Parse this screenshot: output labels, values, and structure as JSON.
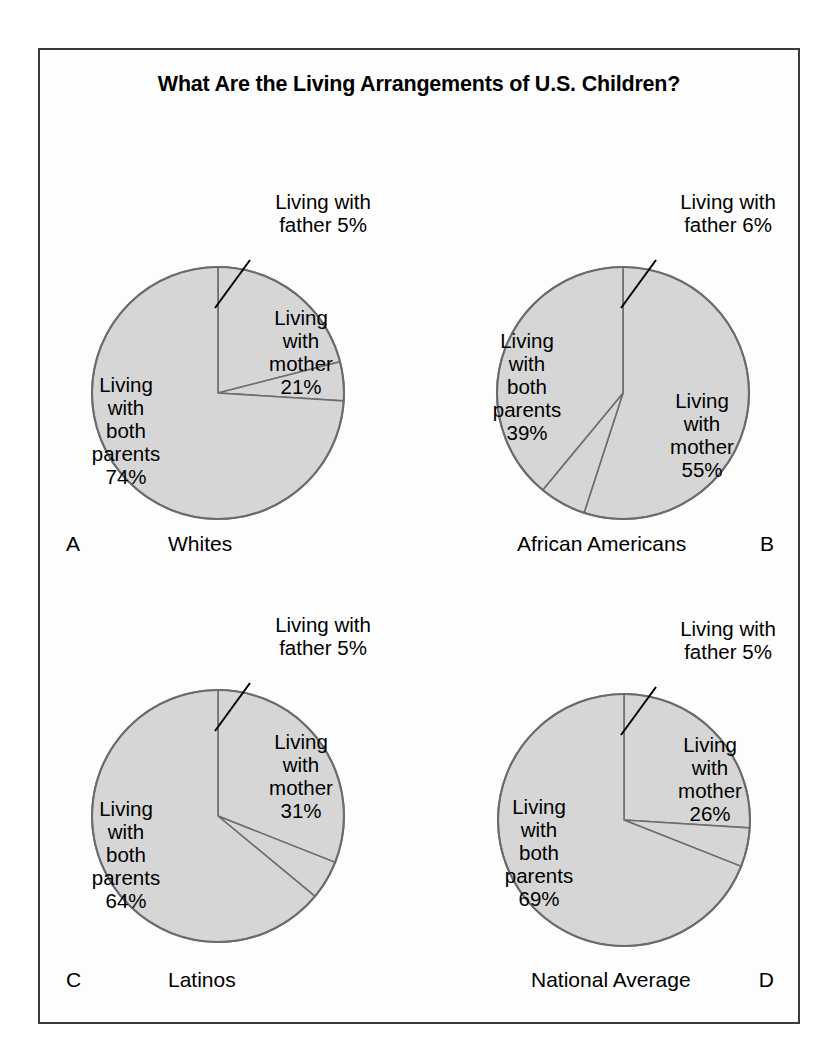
{
  "figure": {
    "title": "What Are the Living Arrangements of U.S. Children?",
    "background_color": "#fdfdfd",
    "frame_color": "#3a3a3a",
    "slice_fill": "#d6d6d6",
    "slice_stroke": "#6d6d6d"
  },
  "chart_data": {
    "type": "pie",
    "title": "What Are the Living Arrangements of U.S. Children?",
    "xlabel": "",
    "ylabel": "",
    "legend": "none",
    "grid": false,
    "units": "percent",
    "categories": [
      "Living with both parents",
      "Living with mother",
      "Living with father"
    ],
    "panels": [
      {
        "letter": "A",
        "group": "Whites",
        "values": [
          74,
          21,
          5
        ],
        "slices": [
          {
            "label": "Living\nwith\nboth\nparents\n74%",
            "value": 74,
            "text": "74%"
          },
          {
            "label": "Living\nwith\nmother\n21%",
            "value": 21,
            "text": "21%"
          },
          {
            "label": "Living with\nfather 5%",
            "value": 5,
            "text": "5%"
          }
        ]
      },
      {
        "letter": "B",
        "group": "African Americans",
        "values": [
          39,
          55,
          6
        ],
        "slices": [
          {
            "label": "Living\nwith\nboth\nparents\n39%",
            "value": 39,
            "text": "39%"
          },
          {
            "label": "Living\nwith\nmother\n55%",
            "value": 55,
            "text": "55%"
          },
          {
            "label": "Living with\nfather 6%",
            "value": 6,
            "text": "6%"
          }
        ]
      },
      {
        "letter": "C",
        "group": "Latinos",
        "values": [
          64,
          31,
          5
        ],
        "slices": [
          {
            "label": "Living\nwith\nboth\nparents\n64%",
            "value": 64,
            "text": "64%"
          },
          {
            "label": "Living\nwith\nmother\n31%",
            "value": 31,
            "text": "31%"
          },
          {
            "label": "Living with\nfather 5%",
            "value": 5,
            "text": "5%"
          }
        ]
      },
      {
        "letter": "D",
        "group": "National Average",
        "values": [
          69,
          26,
          5
        ],
        "slices": [
          {
            "label": "Living\nwith\nboth\nparents\n69%",
            "value": 69,
            "text": "69%"
          },
          {
            "label": "Living\nwith\nmother\n26%",
            "value": 26,
            "text": "26%"
          },
          {
            "label": "Living with\nfather 5%",
            "value": 5,
            "text": "5%"
          }
        ]
      }
    ]
  }
}
